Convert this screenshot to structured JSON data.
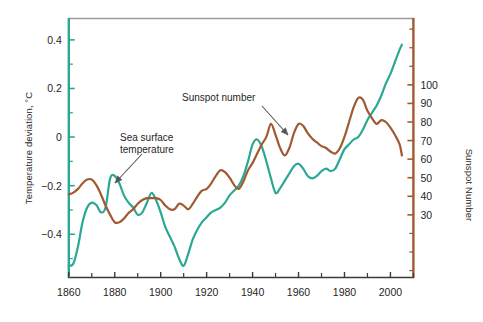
{
  "chart_data": {
    "type": "line",
    "title": "",
    "xlabel": "",
    "xlim": [
      1860,
      2010
    ],
    "x_ticks_major": [
      1860,
      1880,
      1900,
      1920,
      1940,
      1960,
      1980,
      2000
    ],
    "x_ticks_minor": [
      1870,
      1890,
      1910,
      1930,
      1950,
      1970,
      1990,
      2010
    ],
    "grid": false,
    "legend_position": "inline-annotations",
    "axes": [
      {
        "id": "left",
        "label": "Temperature deviation, °C",
        "color": "#2AA893",
        "ticks": [
          0.4,
          0.2,
          0,
          -0.2,
          -0.4
        ],
        "tick_labels": [
          "0.4",
          "0.2",
          "0",
          "−0.2",
          "−0.4"
        ],
        "lim": [
          -0.58,
          0.49
        ],
        "minor_tick_step": 0.1
      },
      {
        "id": "right",
        "label": "Sunspot Number",
        "color": "#A05A32",
        "ticks": [
          100,
          90,
          80,
          70,
          60,
          50,
          40,
          30
        ],
        "tick_labels": [
          "100",
          "90",
          "80",
          "70",
          "60",
          "50",
          "40",
          "30"
        ],
        "lim": [
          -4,
          136
        ],
        "minor_tick_step": 10
      }
    ],
    "series": [
      {
        "name": "Sea surface temperature",
        "axis": "left",
        "color": "#2AA893",
        "x": [
          1860,
          1862,
          1864,
          1866,
          1868,
          1870,
          1872,
          1874,
          1876,
          1878,
          1880,
          1882,
          1884,
          1886,
          1888,
          1890,
          1892,
          1894,
          1896,
          1898,
          1900,
          1902,
          1904,
          1906,
          1908,
          1910,
          1912,
          1914,
          1916,
          1918,
          1920,
          1922,
          1924,
          1926,
          1928,
          1930,
          1932,
          1934,
          1936,
          1938,
          1940,
          1942,
          1944,
          1946,
          1948,
          1950,
          1952,
          1954,
          1956,
          1958,
          1960,
          1962,
          1964,
          1966,
          1968,
          1970,
          1972,
          1974,
          1976,
          1978,
          1980,
          1982,
          1984,
          1986,
          1988,
          1990,
          1992,
          1994,
          1996,
          1998,
          2000,
          2002,
          2004,
          2005
        ],
        "y": [
          -0.53,
          -0.52,
          -0.45,
          -0.35,
          -0.29,
          -0.27,
          -0.28,
          -0.31,
          -0.29,
          -0.17,
          -0.16,
          -0.19,
          -0.24,
          -0.27,
          -0.29,
          -0.32,
          -0.31,
          -0.27,
          -0.23,
          -0.26,
          -0.31,
          -0.37,
          -0.41,
          -0.45,
          -0.5,
          -0.53,
          -0.48,
          -0.42,
          -0.38,
          -0.35,
          -0.33,
          -0.31,
          -0.3,
          -0.29,
          -0.27,
          -0.24,
          -0.22,
          -0.2,
          -0.16,
          -0.1,
          -0.03,
          -0.01,
          -0.04,
          -0.1,
          -0.17,
          -0.23,
          -0.21,
          -0.18,
          -0.15,
          -0.12,
          -0.11,
          -0.13,
          -0.16,
          -0.17,
          -0.16,
          -0.14,
          -0.13,
          -0.14,
          -0.13,
          -0.09,
          -0.05,
          -0.03,
          -0.01,
          0.0,
          0.03,
          0.07,
          0.1,
          0.13,
          0.17,
          0.22,
          0.26,
          0.31,
          0.36,
          0.38
        ],
        "annotation": {
          "text_line_1": "Sea surface",
          "text_line_2": "temperature",
          "text_x": 120,
          "text_y": 141,
          "arrow_from_x": 142,
          "arrow_from_y": 154,
          "arrow_to_x": 115,
          "arrow_to_y": 183
        }
      },
      {
        "name": "Sunspot number",
        "axis": "right",
        "color": "#A05A32",
        "x": [
          1860,
          1862,
          1864,
          1866,
          1868,
          1870,
          1872,
          1874,
          1876,
          1878,
          1880,
          1882,
          1884,
          1886,
          1888,
          1890,
          1892,
          1894,
          1896,
          1898,
          1900,
          1902,
          1904,
          1906,
          1908,
          1910,
          1912,
          1914,
          1916,
          1918,
          1920,
          1922,
          1924,
          1926,
          1928,
          1930,
          1932,
          1934,
          1936,
          1938,
          1940,
          1942,
          1944,
          1946,
          1948,
          1950,
          1952,
          1954,
          1956,
          1958,
          1960,
          1962,
          1964,
          1966,
          1968,
          1970,
          1972,
          1974,
          1976,
          1978,
          1980,
          1982,
          1984,
          1986,
          1988,
          1990,
          1992,
          1994,
          1996,
          1998,
          2000,
          2002,
          2004,
          2005
        ],
        "y": [
          41,
          42,
          44,
          47,
          49,
          49,
          46,
          41,
          35,
          30,
          26,
          26,
          28,
          31,
          33,
          36,
          38,
          39,
          39,
          39,
          38,
          35,
          33,
          33,
          36,
          35,
          33,
          36,
          40,
          43,
          44,
          47,
          51,
          54,
          53,
          50,
          46,
          44,
          48,
          54,
          58,
          63,
          68,
          72,
          79,
          73,
          66,
          62,
          66,
          74,
          79,
          78,
          74,
          71,
          69,
          67,
          66,
          64,
          63,
          66,
          72,
          80,
          88,
          93,
          92,
          86,
          82,
          79,
          81,
          80,
          77,
          73,
          68,
          62
        ],
        "annotation": {
          "text": "Sunspot number",
          "text_x": 182,
          "text_y": 101,
          "arrow_from_x": 262,
          "arrow_from_y": 106,
          "arrow_to_x": 288,
          "arrow_to_y": 135
        }
      }
    ]
  },
  "frame": {
    "top_border_color": "#9b9b9b",
    "bottom_border_color": "#3a3a3a",
    "left_border_color": "#2AA893",
    "right_border_color": "#A05A32"
  }
}
